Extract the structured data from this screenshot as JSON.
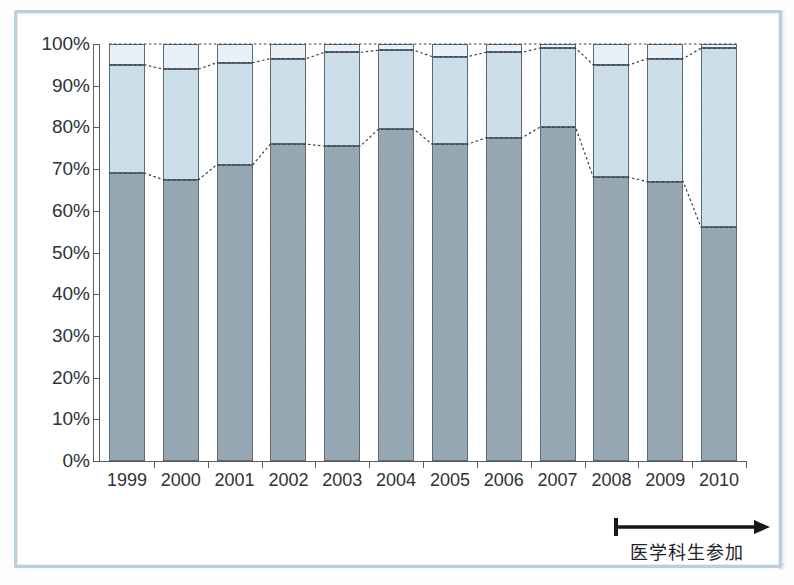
{
  "chart_data": {
    "type": "bar",
    "subtype": "100% stacked column",
    "title": "",
    "xlabel": "",
    "ylabel": "",
    "categories": [
      "1999",
      "2000",
      "2001",
      "2002",
      "2003",
      "2004",
      "2005",
      "2006",
      "2007",
      "2008",
      "2009",
      "2010"
    ],
    "ylim": [
      0,
      100
    ],
    "ytick_labels": [
      "0%",
      "10%",
      "20%",
      "30%",
      "40%",
      "50%",
      "60%",
      "70%",
      "80%",
      "90%",
      "100%"
    ],
    "ytick_values": [
      0,
      10,
      20,
      30,
      40,
      50,
      60,
      70,
      80,
      90,
      100
    ],
    "grid": false,
    "legend": "none",
    "series": [
      {
        "name": "bottom-segment",
        "color": "#8ea1af",
        "values": [
          69,
          67.5,
          71,
          76,
          75.5,
          79.5,
          76,
          77.5,
          80,
          68,
          67,
          56
        ]
      },
      {
        "name": "middle-segment",
        "color": "#c3d8e6",
        "values": [
          26,
          26.5,
          24.5,
          20.5,
          22.5,
          19,
          21,
          20.5,
          19,
          27,
          29.5,
          43
        ]
      },
      {
        "name": "top-segment",
        "color": "#e8f1f7",
        "values": [
          5,
          6,
          4.5,
          3.5,
          2,
          1.5,
          3,
          2,
          1,
          5,
          3.5,
          1
        ]
      }
    ],
    "cumulative_boundaries": {
      "bottom_top": [
        69,
        67.5,
        71,
        76,
        75.5,
        79.5,
        76,
        77.5,
        80,
        68,
        67,
        56
      ],
      "middle_top": [
        95,
        94,
        95.5,
        96.5,
        98,
        98.5,
        97,
        98,
        99,
        95,
        96.5,
        99
      ],
      "total": [
        100,
        100,
        100,
        100,
        100,
        100,
        100,
        100,
        100,
        100,
        100,
        100
      ]
    },
    "connector_lines": {
      "style": "dotted",
      "color": "#3a4249",
      "description": "dotted leader lines joining matching segment boundaries across adjacent bars"
    },
    "annotations": [
      {
        "name": "medical-student-participation",
        "text": "医学科生参加",
        "marker": "arrow-right-with-start-bar",
        "spans_from_category": "2007",
        "spans_to_category": "2010"
      }
    ]
  },
  "bottom_sliver_text": "",
  "icons": {
    "arrow": "arrow-right-icon"
  }
}
